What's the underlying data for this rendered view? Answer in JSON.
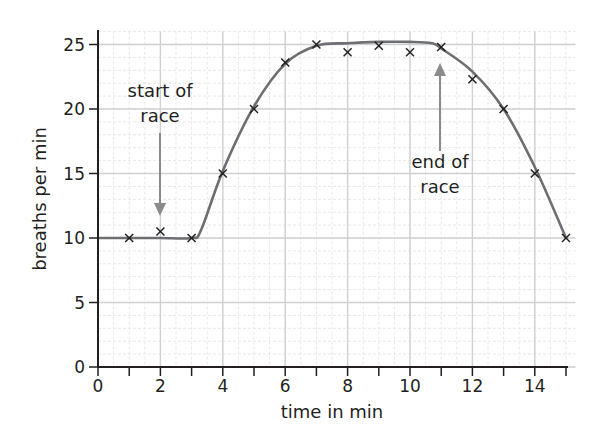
{
  "chart_data": {
    "type": "scatter",
    "title": "",
    "xlabel": "time in min",
    "ylabel": "breaths per min",
    "xlim": [
      0,
      15
    ],
    "ylim": [
      0,
      25
    ],
    "x_ticks": [
      0,
      2,
      4,
      6,
      8,
      10,
      12,
      14
    ],
    "x_minor_ticks": [
      1,
      3,
      5,
      7,
      9,
      11,
      13,
      15
    ],
    "y_ticks": [
      0,
      5,
      10,
      15,
      20,
      25
    ],
    "grid": true,
    "legend": null,
    "series": [
      {
        "name": "measured breathing rate",
        "marker": "x",
        "x": [
          1,
          2,
          3,
          4,
          5,
          6,
          7,
          8,
          9,
          10,
          11,
          12,
          13,
          14,
          15
        ],
        "y": [
          10,
          10.5,
          10,
          15,
          20,
          23.6,
          25,
          24.4,
          24.9,
          24.4,
          24.8,
          22.3,
          20,
          15,
          10
        ]
      },
      {
        "name": "line of best fit",
        "type": "line",
        "x": [
          0,
          1,
          2,
          3,
          3.3,
          4,
          5,
          6,
          7,
          8,
          9,
          10,
          10.7,
          11,
          12,
          13,
          14,
          15
        ],
        "y": [
          10,
          10,
          10,
          10,
          10.6,
          15.2,
          20.2,
          23.5,
          24.9,
          25.1,
          25.2,
          25.2,
          25.1,
          24.7,
          22.9,
          20.0,
          15.5,
          10
        ]
      }
    ],
    "annotations": [
      {
        "text_lines": [
          "start of",
          "race"
        ],
        "arrow_to": {
          "x": 2,
          "y": 11.5
        },
        "direction": "down"
      },
      {
        "text_lines": [
          "end of",
          "race"
        ],
        "arrow_to": {
          "x": 11,
          "y": 23.5
        },
        "direction": "up"
      }
    ],
    "colors": {
      "axis": "#231f20",
      "curve": "#6d6e71",
      "marker": "#231f20",
      "arrow": "#8a8b8d",
      "grid_major": "#cfd0d2",
      "grid_minor": "#e6e7e8"
    }
  },
  "labels": {
    "xlabel": "time in min",
    "ylabel": "breaths per min",
    "start_line1": "start of",
    "start_line2": "race",
    "end_line1": "end of",
    "end_line2": "race",
    "x_ticks": [
      "0",
      "2",
      "4",
      "6",
      "8",
      "10",
      "12",
      "14"
    ],
    "y_ticks": [
      "0",
      "5",
      "10",
      "15",
      "20",
      "25"
    ]
  }
}
